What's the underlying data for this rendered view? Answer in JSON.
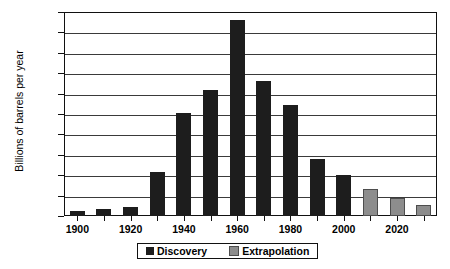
{
  "chart_data": {
    "type": "bar",
    "title": "",
    "xlabel": "",
    "ylabel": "Billions of barrels per year",
    "ylim": [
      0,
      500
    ],
    "ytick_step": 50,
    "yticks": [
      0,
      50,
      100,
      150,
      200,
      250,
      300,
      350,
      400,
      450,
      500
    ],
    "xticklabels": [
      "1900",
      "1920",
      "1940",
      "1960",
      "1980",
      "2000",
      "2020"
    ],
    "xtick_values": [
      1900,
      1920,
      1940,
      1960,
      1980,
      2000,
      2020
    ],
    "xlim": [
      1895,
      2035
    ],
    "grid": true,
    "legend_position": "bottom-center",
    "categories": [
      1900,
      1910,
      1920,
      1930,
      1940,
      1950,
      1960,
      1970,
      1980,
      1990,
      2000,
      2010,
      2020,
      2030
    ],
    "series": [
      {
        "name": "Discovery",
        "color": "#1d1d1d",
        "x": [
          1900,
          1910,
          1920,
          1930,
          1940,
          1950,
          1960,
          1970,
          1980,
          1990,
          2000
        ],
        "values": [
          13,
          18,
          22,
          108,
          252,
          308,
          480,
          330,
          272,
          140,
          100
        ]
      },
      {
        "name": "Extrapolation",
        "color": "#8d8d8d",
        "x": [
          2010,
          2020,
          2030
        ],
        "values": [
          65,
          45,
          28
        ]
      }
    ]
  },
  "legend": {
    "items": [
      {
        "label": "Discovery",
        "swatch": "discovery-swatch"
      },
      {
        "label": "Extrapolation",
        "swatch": "extrapolation-swatch"
      }
    ]
  },
  "axes": {
    "y_title": "Billions of barrels per year"
  }
}
